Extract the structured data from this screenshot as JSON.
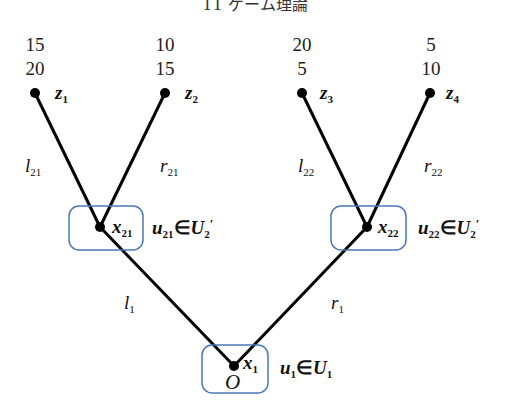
{
  "title": "11 ゲーム理論",
  "colors": {
    "edge": "#000000",
    "node": "#000000",
    "info_set_box": "#4a78b8",
    "text": "#222222"
  },
  "root": {
    "label": "O",
    "node": "x",
    "node_sub": "1",
    "action": "u",
    "action_sub": "1",
    "set": "U",
    "set_sub": "1",
    "elem": "∈"
  },
  "left_branch": {
    "edge": "l",
    "edge_sub": "1"
  },
  "right_branch": {
    "edge": "r",
    "edge_sub": "1"
  },
  "x21": {
    "node": "x",
    "node_sub": "21",
    "action": "u",
    "action_sub": "21",
    "set": "U",
    "set_sub": "2",
    "set_sup": "′",
    "elem": "∈",
    "left_edge": "l",
    "left_edge_sub": "21",
    "right_edge": "r",
    "right_edge_sub": "21"
  },
  "x22": {
    "node": "x",
    "node_sub": "22",
    "action": "u",
    "action_sub": "22",
    "set": "U",
    "set_sub": "2",
    "set_sup": "′",
    "elem": "∈",
    "left_edge": "l",
    "left_edge_sub": "22",
    "right_edge": "r",
    "right_edge_sub": "22"
  },
  "terminals": [
    {
      "name": "z",
      "sub": "1",
      "payoff_top": "15",
      "payoff_bottom": "20"
    },
    {
      "name": "z",
      "sub": "2",
      "payoff_top": "10",
      "payoff_bottom": "15"
    },
    {
      "name": "z",
      "sub": "3",
      "payoff_top": "20",
      "payoff_bottom": "5"
    },
    {
      "name": "z",
      "sub": "4",
      "payoff_top": "5",
      "payoff_bottom": "10"
    }
  ]
}
